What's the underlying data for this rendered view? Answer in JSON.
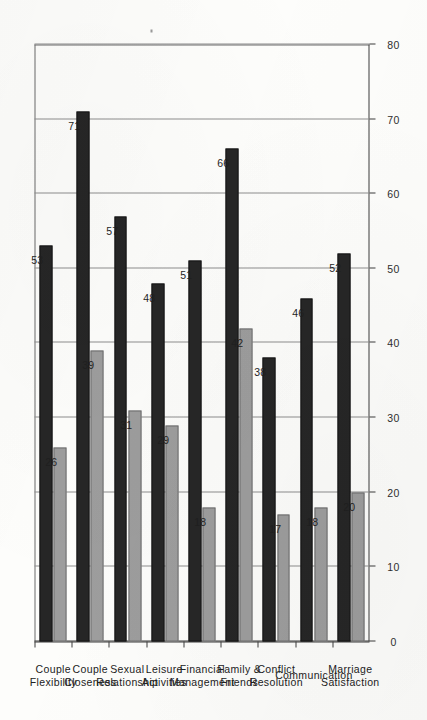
{
  "chart_data": {
    "type": "bar",
    "orientation": "horizontal",
    "page_rotation_degrees": -90,
    "title": "",
    "subtitle": "",
    "xlabel": "",
    "ylabel": "",
    "xlim": [
      0,
      80
    ],
    "x_tick_labels": [
      "0",
      "10",
      "20",
      "30",
      "40",
      "50",
      "60",
      "70",
      "80"
    ],
    "x_ticks": [
      0,
      10,
      20,
      30,
      40,
      50,
      60,
      70,
      80
    ],
    "grid": true,
    "grid_axis": "x",
    "legend": "none",
    "legend_position": "none",
    "categories": [
      "Marriage\nSatisfaction",
      "Communication",
      "Conflict\nResolution",
      "Family &\nFriends",
      "Financial\nManagement",
      "Leisure\nActivities",
      "Sexual\nRelationship",
      "Couple\nCloseness",
      "Couple\nFlexibility"
    ],
    "category_lines": [
      [
        "Marriage",
        "Satisfaction"
      ],
      [
        "Communication"
      ],
      [
        "Conflict",
        "Resolution"
      ],
      [
        "Family &",
        "Friends"
      ],
      [
        "Financial",
        "Management"
      ],
      [
        "Leisure",
        "Activities"
      ],
      [
        "Sexual",
        "Relationship"
      ],
      [
        "Couple",
        "Closeness"
      ],
      [
        "Couple",
        "Flexibility"
      ]
    ],
    "series": [
      {
        "name": "dark",
        "color": "#262626",
        "values": [
          52,
          46,
          38,
          66,
          51,
          48,
          57,
          71,
          53
        ],
        "value_labels": [
          "52",
          "46",
          "38",
          "66",
          "51",
          "48",
          "57",
          "71",
          "53"
        ]
      },
      {
        "name": "gray",
        "color": "#9d9d9d",
        "values": [
          20,
          18,
          17,
          42,
          18,
          29,
          31,
          39,
          26
        ],
        "value_labels": [
          "20",
          "18",
          "17",
          "42",
          "18",
          "29",
          "31",
          "39",
          "26"
        ]
      }
    ],
    "annotations": [
      {
        "kind": "bracket",
        "text": "",
        "spans_categories": [
          "Conflict\nResolution",
          "Sexual\nRelationship"
        ],
        "span_start_index": 2,
        "span_end_index": 6
      }
    ],
    "colors": {
      "series_dark": "#262626",
      "series_gray": "#9d9d9d",
      "axis": "#3d3d3d",
      "gridline": "#8d8d8d",
      "text": "#222222",
      "background": "#fdfdfb"
    }
  }
}
